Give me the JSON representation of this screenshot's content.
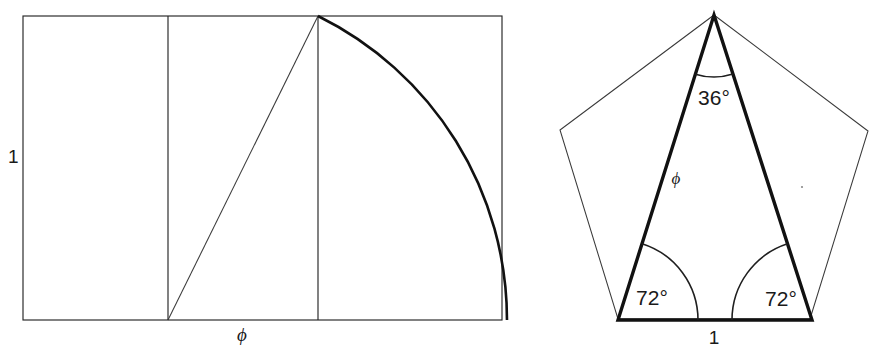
{
  "figure": {
    "stroke_color": "#111111",
    "thin_stroke_color": "#3a3a3a",
    "background": "#ffffff"
  },
  "left_panel": {
    "name": "golden-rectangle-construction",
    "side_label": "1",
    "base_label": "ϕ",
    "rect": {
      "x": 23,
      "y": 16,
      "width": 479,
      "height": 304
    },
    "divider_1_x": 168,
    "divider_2_x": 318,
    "apex": {
      "x": 318,
      "y": 16
    },
    "arc_center": {
      "x": 168,
      "y": 320
    },
    "arc_radius": 335,
    "diagonal_from": {
      "x": 168,
      "y": 320
    },
    "diagonal_to": {
      "x": 318,
      "y": 16
    }
  },
  "right_panel": {
    "name": "pentagon-golden-triangle",
    "apex_angle_label": "36°",
    "base_angle_left_label": "72°",
    "base_angle_right_label": "72°",
    "leg_label": "ϕ",
    "base_label": "1",
    "pentagon_vertices": [
      {
        "x": 714,
        "y": 15
      },
      {
        "x": 868,
        "y": 131
      },
      {
        "x": 810,
        "y": 319
      },
      {
        "x": 618,
        "y": 319
      },
      {
        "x": 560,
        "y": 130
      }
    ],
    "triangle_vertices": [
      {
        "x": 714,
        "y": 15
      },
      {
        "x": 812,
        "y": 320
      },
      {
        "x": 618,
        "y": 320
      }
    ]
  },
  "chart_data": {
    "type": "diagram",
    "panels": [
      {
        "id": "golden-rectangle",
        "description": "Unit-height rectangle of width ϕ built from a square, with quarter-circle arc swung from the midpoint of the square's base through the opposite corner.",
        "labels": [
          {
            "text": "1",
            "meaning": "rectangle height (unit)"
          },
          {
            "text": "ϕ",
            "meaning": "rectangle width (golden ratio)"
          }
        ],
        "values": {
          "height": 1,
          "width": 1.618
        }
      },
      {
        "id": "golden-gnomon-pentagon",
        "description": "Regular pentagon with inscribed golden triangle: apex 36 degrees, base angles 72 degrees, base 1 and legs ϕ.",
        "labels": [
          {
            "text": "36°",
            "meaning": "apex angle"
          },
          {
            "text": "72°",
            "meaning": "left base angle"
          },
          {
            "text": "72°",
            "meaning": "right base angle"
          },
          {
            "text": "ϕ",
            "meaning": "leg length"
          },
          {
            "text": "1",
            "meaning": "base length"
          }
        ],
        "values": {
          "apex_angle": 36,
          "base_angle": 72,
          "base": 1,
          "leg": 1.618
        }
      }
    ]
  }
}
